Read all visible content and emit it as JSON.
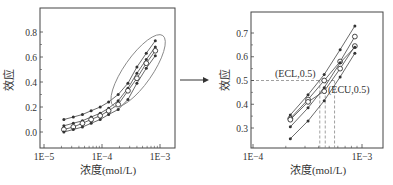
{
  "colors": {
    "ink": "#333333",
    "line": "#444444",
    "ellipse": "#888888",
    "dash": "#888888",
    "bg": "#ffffff"
  },
  "arrow": {
    "label": ""
  },
  "chart_data": [
    {
      "type": "line",
      "title": "",
      "xlabel": "浓度(mol/L)",
      "ylabel": "效应",
      "xscale": "log",
      "xlim": [
        1e-05,
        0.0013
      ],
      "ylim": [
        -0.08,
        0.9
      ],
      "xticks": [
        {
          "value": 1e-05,
          "label": "1E−5"
        },
        {
          "value": 0.0001,
          "label": "1E−4"
        },
        {
          "value": 0.001,
          "label": "1E−3"
        }
      ],
      "yticks": [
        {
          "value": 0.0,
          "label": "0.0"
        },
        {
          "value": 0.2,
          "label": "0.2"
        },
        {
          "value": 0.4,
          "label": "0.4"
        },
        {
          "value": 0.6,
          "label": "0.6"
        },
        {
          "value": 0.8,
          "label": "0.8"
        }
      ],
      "x": [
        2.2e-05,
        3.2e-05,
        4.6e-05,
        6.5e-05,
        9.3e-05,
        0.00013,
        0.00019,
        0.00028,
        0.0004,
        0.00058,
        0.00083
      ],
      "series": [
        {
          "name": "upper",
          "marker": "dot",
          "values": [
            0.1,
            0.12,
            0.14,
            0.17,
            0.2,
            0.24,
            0.3,
            0.39,
            0.52,
            0.63,
            0.73
          ]
        },
        {
          "name": "mid-upper",
          "marker": "dot",
          "values": [
            0.05,
            0.07,
            0.09,
            0.12,
            0.15,
            0.19,
            0.25,
            0.35,
            0.47,
            0.58,
            0.68
          ]
        },
        {
          "name": "mean",
          "marker": "circle",
          "values": [
            0.02,
            0.04,
            0.07,
            0.1,
            0.13,
            0.17,
            0.22,
            0.33,
            0.43,
            0.55,
            0.65
          ]
        },
        {
          "name": "lower",
          "marker": "dot",
          "values": [
            0.0,
            0.02,
            0.04,
            0.07,
            0.1,
            0.14,
            0.18,
            0.26,
            0.39,
            0.51,
            0.61
          ]
        }
      ],
      "annotations": [
        {
          "type": "ellipse",
          "label": "highlighted linear region",
          "x_range": [
            0.00016,
            0.0011
          ],
          "y_range": [
            0.2,
            0.78
          ]
        }
      ]
    },
    {
      "type": "line",
      "title": "",
      "xlabel": "浓度(mol/L)",
      "ylabel": "效应",
      "xscale": "log",
      "xlim": [
        9e-05,
        0.0016
      ],
      "ylim": [
        0.24,
        0.78
      ],
      "xticks": [
        {
          "value": 0.0001,
          "label": "1E−4"
        },
        {
          "value": 0.001,
          "label": "1E−3"
        }
      ],
      "yticks": [
        {
          "value": 0.3,
          "label": "0.3"
        },
        {
          "value": 0.4,
          "label": "0.4"
        },
        {
          "value": 0.5,
          "label": "0.5"
        },
        {
          "value": 0.6,
          "label": "0.6"
        },
        {
          "value": 0.7,
          "label": "0.7"
        }
      ],
      "x": [
        0.00022,
        0.00032,
        0.00045,
        0.00063,
        0.00086
      ],
      "series": [
        {
          "name": "upper",
          "marker": "dot",
          "values": [
            0.355,
            0.44,
            0.525,
            0.63,
            0.73
          ]
        },
        {
          "name": "mid-upper",
          "marker": "circle",
          "values": [
            0.34,
            0.42,
            0.5,
            0.58,
            0.685
          ]
        },
        {
          "name": "mean",
          "marker": "circle",
          "values": [
            0.335,
            0.41,
            0.455,
            0.55,
            0.645
          ]
        },
        {
          "name": "mid-lower",
          "marker": "dot",
          "values": [
            0.305,
            0.385,
            0.47,
            0.575,
            0.64
          ]
        },
        {
          "name": "lower",
          "marker": "dot",
          "values": [
            0.255,
            0.33,
            0.415,
            0.515,
            0.615
          ]
        }
      ],
      "annotations": [
        {
          "type": "text",
          "label": "(ECL,0.5)",
          "x": 0.00044,
          "y": 0.5
        },
        {
          "type": "text",
          "label": "(ECU,0.5)",
          "x": 0.00056,
          "y": 0.5
        },
        {
          "type": "hline",
          "style": "dashed",
          "y": 0.5
        },
        {
          "type": "vline",
          "style": "dashed",
          "x": 0.00041
        },
        {
          "type": "vline",
          "style": "dashed",
          "x": 0.00046
        },
        {
          "type": "vline",
          "style": "dashed",
          "x": 0.00056
        }
      ]
    }
  ]
}
